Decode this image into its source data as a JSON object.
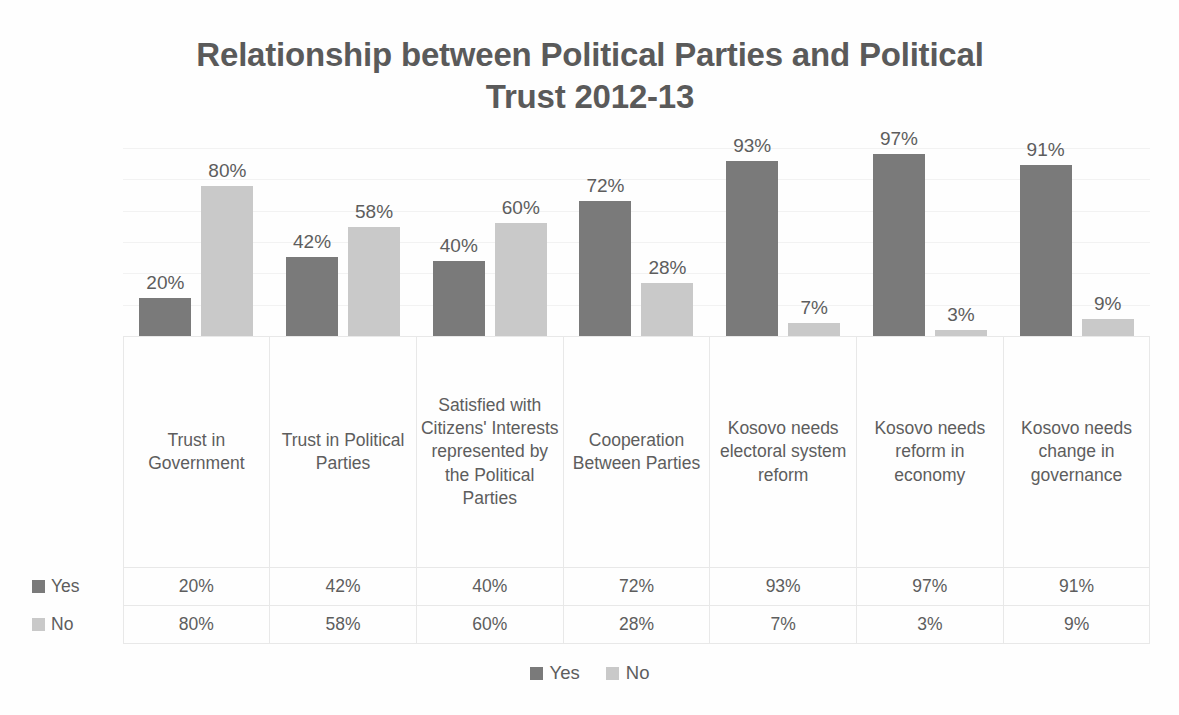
{
  "chart_data": {
    "type": "bar",
    "title": "Relationship between Political Parties and Political Trust 2012-13",
    "title_line1": "Relationship between Political Parties and Political",
    "title_line2": "Trust 2012-13",
    "xlabel": "",
    "ylabel": "",
    "ylim": [
      0,
      100
    ],
    "grid": true,
    "legend_position": "bottom",
    "value_suffix": "%",
    "categories": [
      "Trust in Government",
      "Trust in Political Parties",
      "Satisfied with Citizens' Interests represented by the Political Parties",
      "Cooperation Between Parties",
      "Kosovo needs electoral system reform",
      "Kosovo needs reform in economy",
      "Kosovo needs change in governance"
    ],
    "series": [
      {
        "name": "Yes",
        "color": "#7a7a7a",
        "values": [
          20,
          42,
          40,
          72,
          93,
          97,
          91
        ],
        "labels": [
          "20%",
          "42%",
          "40%",
          "72%",
          "93%",
          "97%",
          "91%"
        ]
      },
      {
        "name": "No",
        "color": "#c9c9c9",
        "values": [
          80,
          58,
          60,
          28,
          7,
          3,
          9
        ],
        "labels": [
          "80%",
          "58%",
          "60%",
          "28%",
          "7%",
          "3%",
          "9%"
        ]
      }
    ]
  },
  "table": {
    "category_labels": [
      "Trust in Government",
      "Trust in Political Parties",
      "Satisfied with Citizens' Interests represented by the Political Parties",
      "Cooperation Between Parties",
      "Kosovo needs electoral system reform",
      "Kosovo needs reform in economy",
      "Kosovo needs change in governance"
    ],
    "rows": [
      {
        "label": "Yes",
        "cells": [
          "20%",
          "42%",
          "40%",
          "72%",
          "93%",
          "97%",
          "91%"
        ]
      },
      {
        "label": "No",
        "cells": [
          "80%",
          "58%",
          "60%",
          "28%",
          "7%",
          "3%",
          "9%"
        ]
      }
    ]
  },
  "legend": {
    "items": [
      {
        "label": "Yes",
        "color": "#7a7a7a"
      },
      {
        "label": "No",
        "color": "#c9c9c9"
      }
    ]
  },
  "colors": {
    "yes": "#7a7a7a",
    "no": "#c9c9c9",
    "text": "#5d5d5d",
    "title": "#5a5a5a",
    "grid": "#f2f2f2",
    "table_border": "#e8e8e8",
    "background": "#ffffff"
  }
}
